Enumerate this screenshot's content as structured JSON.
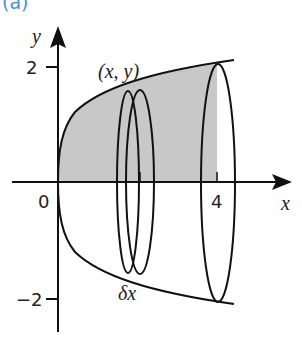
{
  "figure": {
    "part_label": "(a)",
    "axes": {
      "x_label": "x",
      "y_label": "y",
      "origin_label": "0",
      "x_tick_label": "4",
      "y_tick_top": "2",
      "y_tick_bottom": "−2"
    },
    "annotations": {
      "point": "(x, y)",
      "slab_width": "δx"
    },
    "colors": {
      "shade": "#c8c8c8",
      "stroke": "#111111",
      "part_label": "#4a8fd6"
    }
  }
}
